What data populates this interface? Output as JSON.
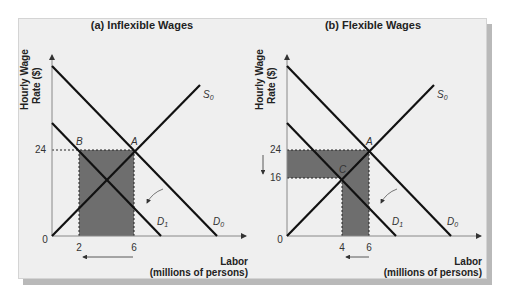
{
  "panels": [
    {
      "title": "(a) Inflexible Wages",
      "y_axis_label_line1": "Hourly Wage",
      "y_axis_label_line2": "Rate ($)",
      "x_axis_label_line1": "Labor",
      "x_axis_label_line2": "(millions of persons)",
      "origin_label": "0",
      "y_ticks": [
        "24"
      ],
      "x_ticks": [
        "2",
        "6"
      ],
      "points": {
        "A": "A",
        "B": "B"
      },
      "curves": {
        "S0": "S",
        "S0_sub": "0",
        "D0": "D",
        "D0_sub": "0",
        "D1": "D",
        "D1_sub": "1"
      }
    },
    {
      "title": "(b) Flexible Wages",
      "y_axis_label_line1": "Hourly Wage",
      "y_axis_label_line2": "Rate ($)",
      "x_axis_label_line1": "Labor",
      "x_axis_label_line2": "(millions of persons)",
      "origin_label": "0",
      "y_ticks": [
        "24",
        "16"
      ],
      "x_ticks": [
        "4",
        "6"
      ],
      "points": {
        "A": "A",
        "C": "C"
      },
      "curves": {
        "S0": "S",
        "S0_sub": "0",
        "D0": "D",
        "D0_sub": "0",
        "D1": "D",
        "D1_sub": "1"
      }
    }
  ],
  "colors": {
    "panel_bg": "#efefef",
    "shaded_region": "#6e6e6e",
    "curve": "#111111",
    "axis": "#888888"
  }
}
